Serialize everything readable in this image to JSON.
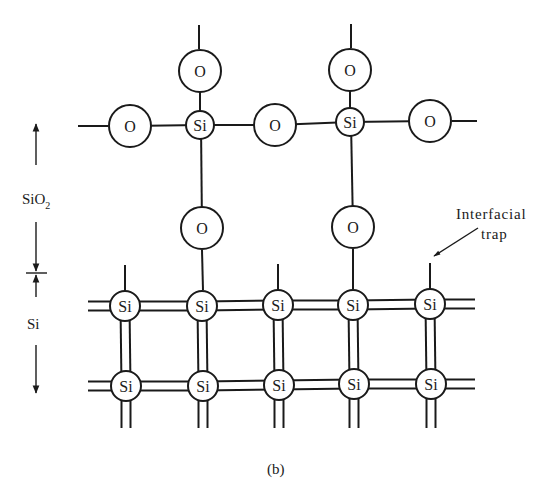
{
  "figure": {
    "caption": "(b)",
    "regions": {
      "oxide_label": "SiO",
      "oxide_subscript": "2",
      "substrate_label": "Si"
    },
    "annotation": {
      "line1": "Interfacial",
      "line2": "trap"
    },
    "atoms": {
      "silicon_symbol": "Si",
      "oxygen_symbol": "O"
    },
    "oxide_layer": {
      "si_atom_count": 2,
      "o_atom_count": 7
    },
    "substrate_lattice": {
      "rows": 2,
      "columns": 5,
      "dangling_bond_columns": [
        1,
        3,
        5
      ],
      "oxide_bonded_columns": [
        2,
        4
      ],
      "trap_column": 5
    }
  }
}
